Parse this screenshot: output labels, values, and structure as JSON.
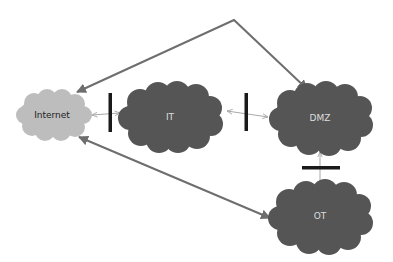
{
  "diagram": {
    "nodes": [
      {
        "id": "internet",
        "label": "Internet",
        "fill": "#bdbdbd",
        "text_color": "#222222"
      },
      {
        "id": "it",
        "label": "IT",
        "fill": "#555555",
        "text_color": "#dddddd"
      },
      {
        "id": "dmz",
        "label": "DMZ",
        "fill": "#555555",
        "text_color": "#dddddd"
      },
      {
        "id": "ot",
        "label": "OT",
        "fill": "#555555",
        "text_color": "#dddddd"
      }
    ],
    "firewalls": [
      {
        "id": "fw-internet-it",
        "orientation": "vertical"
      },
      {
        "id": "fw-it-dmz",
        "orientation": "vertical"
      },
      {
        "id": "fw-dmz-ot",
        "orientation": "horizontal"
      }
    ],
    "edges": [
      {
        "from": "internet",
        "to": "it",
        "style": "thin-bidirectional"
      },
      {
        "from": "it",
        "to": "dmz",
        "style": "thin-bidirectional"
      },
      {
        "from": "dmz",
        "to": "ot",
        "style": "thin-bidirectional"
      },
      {
        "from": "internet",
        "to": "dmz",
        "style": "thick-bidirectional-bent"
      },
      {
        "from": "ot",
        "to": "internet",
        "style": "thick-bidirectional"
      }
    ],
    "colors": {
      "line": "#6e6e6e",
      "firewall": "#1a1a1a",
      "thin_line": "#a8a8a8"
    }
  }
}
